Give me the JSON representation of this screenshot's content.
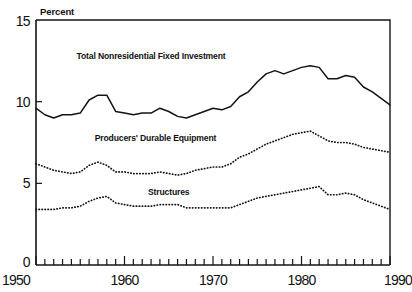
{
  "chart_data": {
    "type": "line",
    "title": "",
    "xlabel": "",
    "ylabel": "Percent",
    "xlim": [
      1950,
      1990
    ],
    "ylim": [
      0,
      15
    ],
    "yticks": [
      0,
      5,
      10,
      15
    ],
    "ytick_labels": [
      "0",
      "5",
      "10",
      "15"
    ],
    "xticks": [
      1950,
      1960,
      1970,
      1980,
      1990
    ],
    "xtick_labels": [
      "1950",
      "1960",
      "1970",
      "1980",
      "1990"
    ],
    "minor_xtick_interval": 1,
    "grid": false,
    "legend_position": "inline-annotations",
    "x": [
      1950,
      1951,
      1952,
      1953,
      1954,
      1955,
      1956,
      1957,
      1958,
      1959,
      1960,
      1961,
      1962,
      1963,
      1964,
      1965,
      1966,
      1967,
      1968,
      1969,
      1970,
      1971,
      1972,
      1973,
      1974,
      1975,
      1976,
      1977,
      1978,
      1979,
      1980,
      1981,
      1982,
      1983,
      1984,
      1985,
      1986,
      1987,
      1988,
      1989,
      1990
    ],
    "series": [
      {
        "name": "Total Nonresidential Fixed Investment",
        "style": "solid",
        "label_x": 1963.0,
        "label_y": 12.6,
        "values": [
          9.6,
          9.2,
          9.0,
          9.2,
          9.2,
          9.3,
          10.1,
          10.4,
          10.4,
          9.4,
          9.3,
          9.2,
          9.3,
          9.3,
          9.6,
          9.4,
          9.1,
          9.0,
          9.2,
          9.4,
          9.6,
          9.5,
          9.7,
          10.3,
          10.6,
          11.2,
          11.7,
          11.9,
          11.7,
          11.9,
          12.1,
          12.2,
          12.1,
          11.4,
          11.4,
          11.6,
          11.5,
          10.9,
          10.6,
          10.2,
          9.8
        ]
      },
      {
        "name": "Producers' Durable Equipment",
        "style": "dotted",
        "label_x": 1963.5,
        "label_y": 7.6,
        "values": [
          6.2,
          6.0,
          5.8,
          5.7,
          5.6,
          5.7,
          6.1,
          6.3,
          6.1,
          5.7,
          5.7,
          5.6,
          5.6,
          5.6,
          5.7,
          5.6,
          5.5,
          5.6,
          5.8,
          5.9,
          6.0,
          6.0,
          6.2,
          6.6,
          6.8,
          7.1,
          7.4,
          7.6,
          7.8,
          8.0,
          8.1,
          8.2,
          7.9,
          7.6,
          7.5,
          7.5,
          7.4,
          7.2,
          7.1,
          7.0,
          6.9
        ]
      },
      {
        "name": "Structures",
        "style": "dotted",
        "label_x": 1965.0,
        "label_y": 4.3,
        "values": [
          3.4,
          3.4,
          3.4,
          3.5,
          3.5,
          3.6,
          3.9,
          4.1,
          4.2,
          3.8,
          3.7,
          3.6,
          3.6,
          3.6,
          3.7,
          3.7,
          3.7,
          3.5,
          3.5,
          3.5,
          3.5,
          3.5,
          3.5,
          3.7,
          3.9,
          4.1,
          4.2,
          4.3,
          4.4,
          4.5,
          4.6,
          4.7,
          4.8,
          4.3,
          4.3,
          4.4,
          4.3,
          4.0,
          3.8,
          3.6,
          3.4
        ]
      }
    ]
  },
  "axes": {
    "y_axis_label": "Percent"
  },
  "colors": {
    "ink": "#141414",
    "background": "#ffffff"
  }
}
